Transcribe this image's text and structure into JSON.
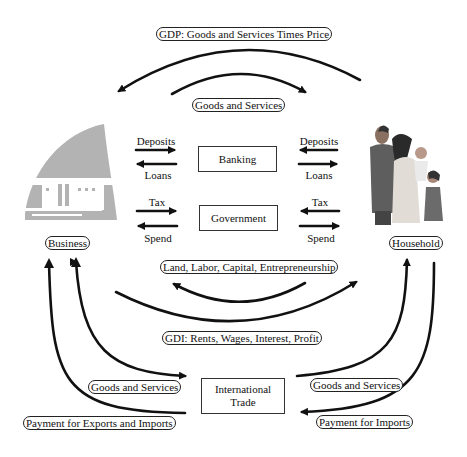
{
  "diagram": {
    "type": "circular-flow",
    "nodes": {
      "business": {
        "label": "Business"
      },
      "household": {
        "label": "Household"
      },
      "banking": {
        "label": "Banking"
      },
      "government": {
        "label": "Government"
      },
      "international_trade": {
        "line1": "International",
        "line2": "Trade"
      }
    },
    "flow_labels": {
      "gdp": "GDP: Goods and Services Times Price",
      "goods_services_top": "Goods and Services",
      "factors": "Land, Labor, Capital, Entrepreneurship",
      "gdi": "GDI: Rents, Wages, Interest, Profit",
      "goods_services_left": "Goods and Services",
      "payment_exports_imports": "Payment for Exports and Imports",
      "goods_services_right": "Goods and Services",
      "payment_imports": "Payment for Imports"
    },
    "banking_flows": {
      "left_top": "Deposits",
      "left_bottom": "Loans",
      "right_top": "Deposits",
      "right_bottom": "Loans"
    },
    "government_flows": {
      "left_top": "Tax",
      "left_bottom": "Spend",
      "right_top": "Tax",
      "right_bottom": "Spend"
    },
    "icons": {
      "business": "office-building-icon",
      "household": "family-icon"
    },
    "colors": {
      "arrow": "#111111",
      "building": "#b3b3b3",
      "box_border": "#333333"
    }
  }
}
